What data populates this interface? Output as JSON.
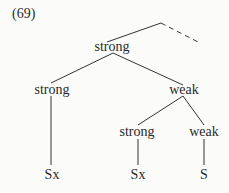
{
  "example_number": "(69)",
  "tree": {
    "root": {
      "label": "strong"
    },
    "left": {
      "label": "strong",
      "leaf": "Sx"
    },
    "right": {
      "label": "weak",
      "children": [
        {
          "label": "strong",
          "leaf": "Sx"
        },
        {
          "label": "weak",
          "leaf": "S"
        }
      ]
    }
  }
}
